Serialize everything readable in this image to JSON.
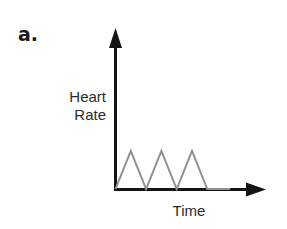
{
  "figure": {
    "panel_label": "a.",
    "background_color": "#ffffff",
    "width": 287,
    "height": 229
  },
  "chart_data": {
    "type": "line",
    "title": "",
    "subtitle": "",
    "panel_label": "a.",
    "xlabel": "Time",
    "ylabel": "Heart\nRate",
    "ylabel_lines": [
      "Heart",
      "Rate"
    ],
    "grid": false,
    "legend": null,
    "legend_position": "none",
    "axis_ticks": false,
    "tick_labels_x": [],
    "tick_labels_y": [],
    "xlim": [
      0,
      10
    ],
    "ylim": [
      0,
      4
    ],
    "series": [
      {
        "name": "Heart Rate",
        "color": "#909090",
        "line_width": 2,
        "x": [
          0,
          1,
          2,
          3,
          4,
          5,
          6,
          7.5
        ],
        "y": [
          0,
          2,
          0,
          2,
          0,
          2,
          0,
          0
        ]
      }
    ],
    "peaks": {
      "count": 3,
      "x": [
        1,
        3,
        5
      ],
      "y": [
        2,
        2,
        2
      ]
    },
    "colors": {
      "axis": "#141414",
      "series": "#909090",
      "text": "#2b2b2b",
      "panel_label": "#1a1a1a",
      "background": "#ffffff"
    }
  },
  "axes": {
    "y_axis_name": "Heart Rate",
    "x_axis_name": "Time",
    "arrowheads": "both"
  }
}
